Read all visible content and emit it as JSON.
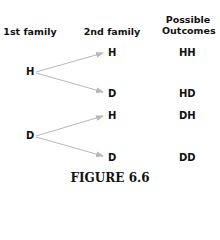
{
  "headers": {
    "first": "1st family",
    "second": "2nd family",
    "outcomes_line1": "Possible",
    "outcomes_line2": "Outcomes"
  },
  "tree": {
    "root_h": "H",
    "root_d": "D",
    "h_children": [
      "H",
      "D"
    ],
    "d_children": [
      "H",
      "D"
    ]
  },
  "outcomes": [
    "HH",
    "HD",
    "DH",
    "DD"
  ],
  "caption": "FIGURE 6.6",
  "colors": {
    "arrow": "#b8b8b8",
    "text": "#111111"
  }
}
